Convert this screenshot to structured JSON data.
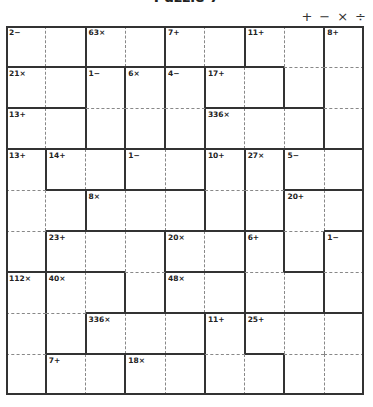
{
  "title": "Puzzle 7",
  "operators": [
    "+",
    "−",
    "×",
    "÷"
  ],
  "grid": {
    "size": 9,
    "cages": [
      {
        "id": "A",
        "clue": "2−",
        "cells": [
          [
            0,
            0
          ],
          [
            0,
            1
          ]
        ]
      },
      {
        "id": "B",
        "clue": "63×",
        "cells": [
          [
            0,
            2
          ],
          [
            0,
            3
          ]
        ]
      },
      {
        "id": "C",
        "clue": "7+",
        "cells": [
          [
            0,
            4
          ],
          [
            0,
            5
          ]
        ]
      },
      {
        "id": "D",
        "clue": "11+",
        "cells": [
          [
            0,
            6
          ],
          [
            0,
            7
          ],
          [
            1,
            7
          ]
        ]
      },
      {
        "id": "E",
        "clue": "8+",
        "cells": [
          [
            0,
            8
          ],
          [
            1,
            8
          ],
          [
            2,
            8
          ]
        ]
      },
      {
        "id": "F",
        "clue": "21×",
        "cells": [
          [
            1,
            0
          ],
          [
            1,
            1
          ]
        ]
      },
      {
        "id": "G",
        "clue": "1−",
        "cells": [
          [
            1,
            2
          ],
          [
            2,
            2
          ]
        ]
      },
      {
        "id": "H",
        "clue": "6×",
        "cells": [
          [
            1,
            3
          ],
          [
            2,
            3
          ]
        ]
      },
      {
        "id": "I",
        "clue": "4−",
        "cells": [
          [
            1,
            4
          ],
          [
            2,
            4
          ]
        ]
      },
      {
        "id": "J",
        "clue": "17+",
        "cells": [
          [
            1,
            5
          ],
          [
            1,
            6
          ]
        ]
      },
      {
        "id": "K",
        "clue": "13+",
        "cells": [
          [
            2,
            0
          ],
          [
            2,
            1
          ]
        ]
      },
      {
        "id": "L",
        "clue": "336×",
        "cells": [
          [
            2,
            5
          ],
          [
            2,
            6
          ],
          [
            2,
            7
          ]
        ]
      },
      {
        "id": "M",
        "clue": "13+",
        "cells": [
          [
            3,
            0
          ],
          [
            4,
            0
          ],
          [
            4,
            1
          ],
          [
            5,
            0
          ]
        ]
      },
      {
        "id": "N",
        "clue": "14+",
        "cells": [
          [
            3,
            1
          ],
          [
            3,
            2
          ]
        ]
      },
      {
        "id": "O",
        "clue": "1−",
        "cells": [
          [
            3,
            3
          ],
          [
            3,
            4
          ]
        ]
      },
      {
        "id": "P",
        "clue": "10+",
        "cells": [
          [
            3,
            5
          ],
          [
            4,
            5
          ]
        ]
      },
      {
        "id": "Q",
        "clue": "27×",
        "cells": [
          [
            3,
            6
          ],
          [
            4,
            6
          ]
        ]
      },
      {
        "id": "R",
        "clue": "5−",
        "cells": [
          [
            3,
            7
          ],
          [
            3,
            8
          ]
        ]
      },
      {
        "id": "S",
        "clue": "8×",
        "cells": [
          [
            4,
            2
          ],
          [
            4,
            3
          ],
          [
            4,
            4
          ]
        ]
      },
      {
        "id": "T",
        "clue": "20+",
        "cells": [
          [
            4,
            7
          ],
          [
            4,
            8
          ],
          [
            5,
            7
          ]
        ]
      },
      {
        "id": "U",
        "clue": "23+",
        "cells": [
          [
            5,
            1
          ],
          [
            5,
            2
          ],
          [
            5,
            3
          ],
          [
            6,
            3
          ]
        ]
      },
      {
        "id": "V",
        "clue": "20×",
        "cells": [
          [
            5,
            4
          ],
          [
            5,
            5
          ]
        ]
      },
      {
        "id": "W",
        "clue": "6+",
        "cells": [
          [
            5,
            6
          ],
          [
            6,
            6
          ],
          [
            6,
            7
          ]
        ]
      },
      {
        "id": "X",
        "clue": "1−",
        "cells": [
          [
            5,
            8
          ],
          [
            6,
            8
          ]
        ]
      },
      {
        "id": "Y",
        "clue": "112×",
        "cells": [
          [
            6,
            0
          ],
          [
            7,
            0
          ],
          [
            8,
            0
          ]
        ]
      },
      {
        "id": "Z",
        "clue": "40×",
        "cells": [
          [
            6,
            1
          ],
          [
            6,
            2
          ],
          [
            7,
            1
          ]
        ]
      },
      {
        "id": "AA",
        "clue": "48×",
        "cells": [
          [
            6,
            4
          ],
          [
            6,
            5
          ]
        ]
      },
      {
        "id": "AB",
        "clue": "336×",
        "cells": [
          [
            7,
            2
          ],
          [
            7,
            3
          ],
          [
            7,
            4
          ]
        ]
      },
      {
        "id": "AC",
        "clue": "11+",
        "cells": [
          [
            7,
            5
          ],
          [
            8,
            5
          ],
          [
            8,
            6
          ]
        ]
      },
      {
        "id": "AD",
        "clue": "25+",
        "cells": [
          [
            7,
            6
          ],
          [
            7,
            7
          ],
          [
            7,
            8
          ],
          [
            8,
            7
          ],
          [
            8,
            8
          ]
        ]
      },
      {
        "id": "AE",
        "clue": "7+",
        "cells": [
          [
            8,
            1
          ],
          [
            8,
            2
          ]
        ]
      },
      {
        "id": "AF",
        "clue": "18×",
        "cells": [
          [
            8,
            3
          ],
          [
            8,
            4
          ]
        ]
      }
    ]
  },
  "colors": {
    "border": "#333333",
    "dashed": "#888888",
    "background": "#ffffff",
    "text": "#222222"
  }
}
